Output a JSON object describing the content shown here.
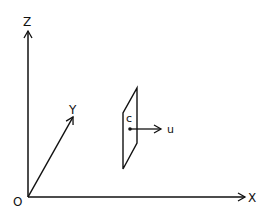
{
  "diagram": {
    "axes": {
      "z_label": "Z",
      "y_label": "Y",
      "x_label": "X",
      "origin_label": "O"
    },
    "plane": {
      "point_label": "c",
      "vector_label": "u"
    },
    "colors": {
      "stroke": "#111111",
      "background": "#ffffff"
    }
  }
}
